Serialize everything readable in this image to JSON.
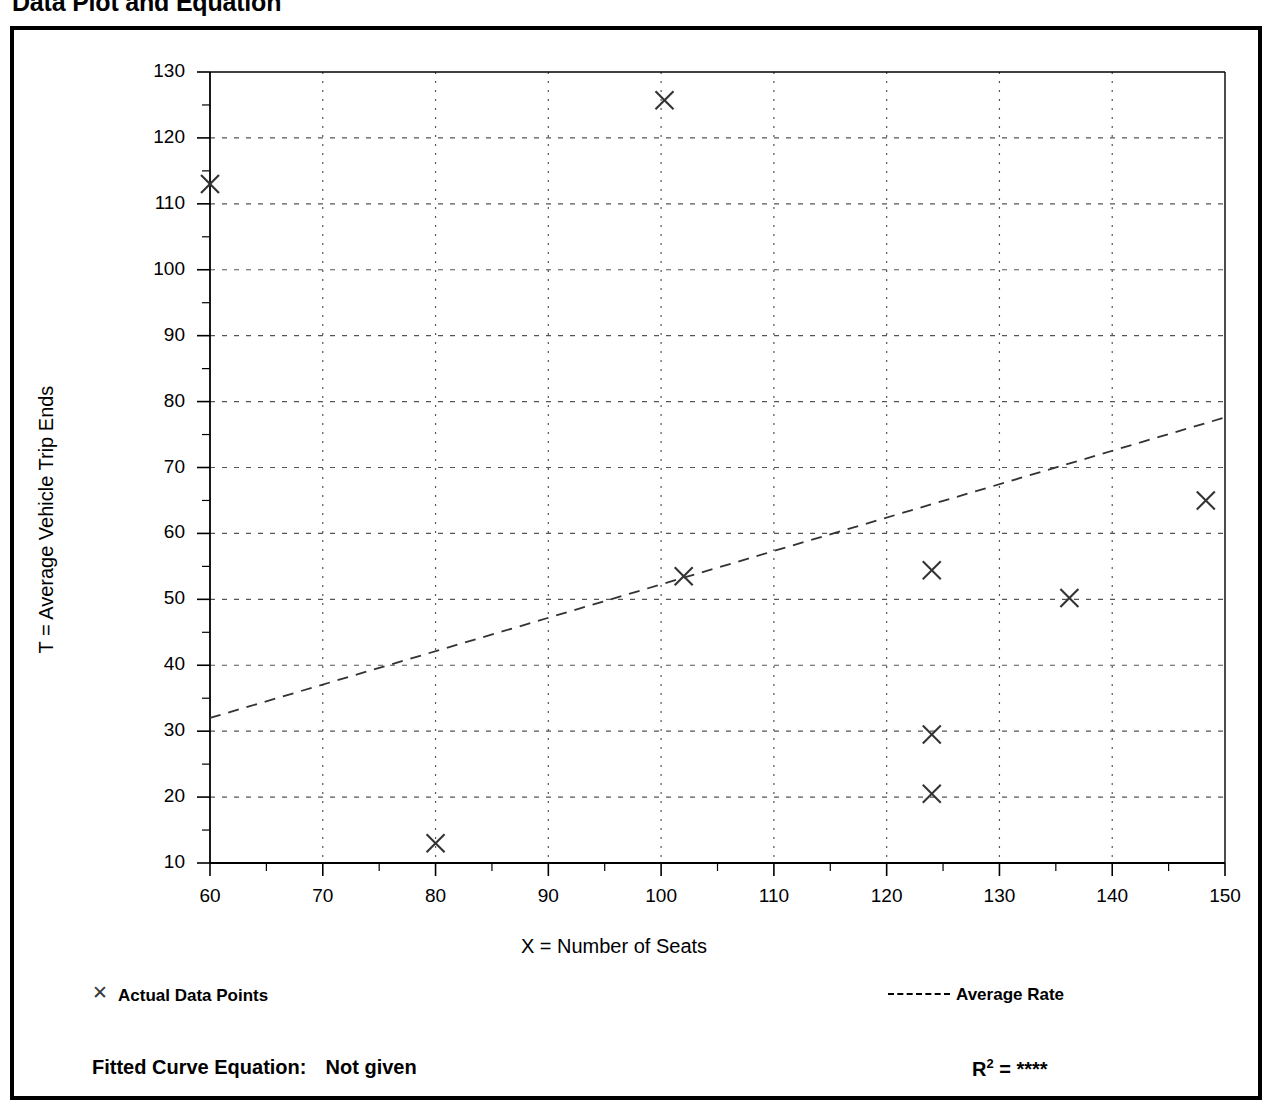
{
  "page_title": "Data Plot and Equation",
  "axes": {
    "x_title": "X = Number of Seats",
    "y_title": "T = Average Vehicle Trip Ends",
    "x_ticks": [
      "60",
      "70",
      "80",
      "90",
      "100",
      "110",
      "120",
      "130",
      "140",
      "150"
    ],
    "y_ticks": [
      "130",
      "120",
      "110",
      "100",
      "90",
      "80",
      "70",
      "60",
      "50",
      "40",
      "30",
      "20",
      "10"
    ]
  },
  "legend": {
    "points_label": "Actual Data Points",
    "points_marker": "x-marker-icon",
    "rate_label": "Average Rate",
    "rate_marker": "dashed-line-icon"
  },
  "footer": {
    "equation_label": "Fitted Curve Equation:",
    "equation_value": "Not given",
    "r2_label": "R",
    "r2_exponent": "2",
    "r2_equals": "=",
    "r2_value": "****"
  },
  "colors": {
    "frame": "#000000",
    "axis": "#000000",
    "grid": "#555555",
    "marker": "#333333",
    "trend": "#333333"
  },
  "chart_data": {
    "type": "scatter",
    "title": "Data Plot and Equation",
    "xlabel": "X = Number of Seats",
    "ylabel": "T = Average Vehicle Trip Ends",
    "xlim": [
      60,
      150
    ],
    "ylim": [
      10,
      130
    ],
    "xtick_step": 10,
    "ytick_step": 10,
    "minor_tick_step": 5,
    "grid": true,
    "grid_style": "dotted",
    "legend_position": "below-plot",
    "series": [
      {
        "name": "Actual Data Points",
        "type": "scatter",
        "marker": "x",
        "points": [
          {
            "x": 60.0,
            "y": 113.0
          },
          {
            "x": 80.0,
            "y": 13.0
          },
          {
            "x": 100.3,
            "y": 125.7
          },
          {
            "x": 102.0,
            "y": 53.5
          },
          {
            "x": 124.0,
            "y": 54.4
          },
          {
            "x": 124.0,
            "y": 29.5
          },
          {
            "x": 124.0,
            "y": 20.5
          },
          {
            "x": 136.2,
            "y": 50.2
          },
          {
            "x": 148.3,
            "y": 65.0
          }
        ]
      },
      {
        "name": "Average Rate",
        "type": "line",
        "style": "dashed",
        "endpoints": [
          {
            "x": 60,
            "y": 32.0
          },
          {
            "x": 150,
            "y": 77.6
          }
        ]
      }
    ],
    "fitted_equation": "Not given",
    "r_squared": "****"
  }
}
